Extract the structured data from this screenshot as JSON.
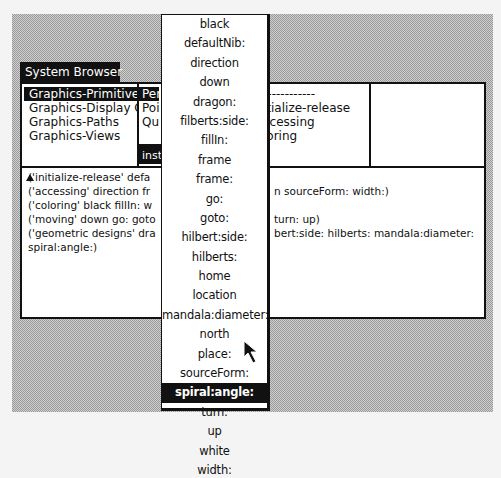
{
  "window": {
    "title": "System Browser"
  },
  "category_pane": {
    "items": [
      {
        "label": "Graphics-Primitive",
        "selected": true
      },
      {
        "label": "Graphics-Display O",
        "selected": false
      },
      {
        "label": "Graphics-Paths",
        "selected": false
      },
      {
        "label": "Graphics-Views",
        "selected": false
      }
    ]
  },
  "class_pane": {
    "items": [
      {
        "label": "Per",
        "selected": true
      },
      {
        "label": "Poi",
        "selected": false
      },
      {
        "label": "Qu",
        "selected": false
      }
    ],
    "toggle_label": "inst"
  },
  "protocol_pane": {
    "items": [
      {
        "label": "------------"
      },
      {
        "label": "itialize-release"
      },
      {
        "label": "ccessing"
      },
      {
        "label": "loring"
      }
    ]
  },
  "method_pane": {
    "items": []
  },
  "code_pane": {
    "lines": [
      "('initialize-release' defa",
      "('accessing' direction fr",
      "('coloring' black fillIn: w",
      "('moving' down go: goto",
      "('geometric designs' dra",
      "spiral:angle:)"
    ],
    "lines_right": [
      "",
      "n sourceForm: width:)",
      "",
      "turn: up)",
      "bert:side: hilberts: mandala:diameter:",
      ""
    ]
  },
  "popup_menu": {
    "items": [
      {
        "label": "black",
        "selected": false
      },
      {
        "label": "defaultNib:",
        "selected": false
      },
      {
        "label": "direction",
        "selected": false
      },
      {
        "label": "down",
        "selected": false
      },
      {
        "label": "dragon:",
        "selected": false
      },
      {
        "label": "filberts:side:",
        "selected": false
      },
      {
        "label": "fillIn:",
        "selected": false
      },
      {
        "label": "frame",
        "selected": false
      },
      {
        "label": "frame:",
        "selected": false
      },
      {
        "label": "go:",
        "selected": false
      },
      {
        "label": "goto:",
        "selected": false
      },
      {
        "label": "hilbert:side:",
        "selected": false
      },
      {
        "label": "hilberts:",
        "selected": false
      },
      {
        "label": "home",
        "selected": false
      },
      {
        "label": "location",
        "selected": false
      },
      {
        "label": "mandala:diameter:",
        "selected": false
      },
      {
        "label": "north",
        "selected": false
      },
      {
        "label": "place:",
        "selected": false
      },
      {
        "label": "sourceForm:",
        "selected": false
      },
      {
        "label": "spiral:angle:",
        "selected": true
      },
      {
        "label": "turn:",
        "selected": false
      },
      {
        "label": "up",
        "selected": false
      },
      {
        "label": "white",
        "selected": false
      },
      {
        "label": "width:",
        "selected": false
      }
    ]
  },
  "colors": {
    "ink": "#111111",
    "paper": "#ffffff",
    "desktop_pattern": "#9a9a9a"
  }
}
